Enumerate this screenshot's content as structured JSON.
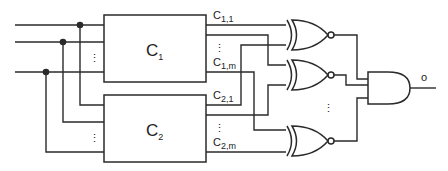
{
  "diagram": {
    "type": "logic-circuit",
    "blocks": [
      {
        "id": "c1",
        "label": "C",
        "subscript": "1"
      },
      {
        "id": "c2",
        "label": "C",
        "subscript": "2"
      }
    ],
    "outputs": [
      {
        "label": "C",
        "subscript": "1,1"
      },
      {
        "label": "C",
        "subscript": "1,m"
      },
      {
        "label": "C",
        "subscript": "2,1"
      },
      {
        "label": "C",
        "subscript": "2,m"
      }
    ],
    "gates": [
      {
        "type": "XNOR",
        "id": "xnor-1"
      },
      {
        "type": "XNOR",
        "id": "xnor-2"
      },
      {
        "type": "XNOR",
        "id": "xnor-m"
      },
      {
        "type": "AND",
        "id": "and-final"
      }
    ],
    "final_output_label": "o",
    "ellipsis": "⋮"
  }
}
